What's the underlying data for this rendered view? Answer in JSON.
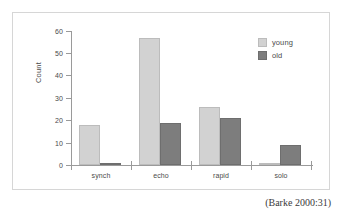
{
  "caption": "(Barke 2000:31)",
  "legend": {
    "position": "top-right",
    "entries": [
      {
        "label": "young",
        "color": "#d2d2d2"
      },
      {
        "label": "old",
        "color": "#7d7d7d"
      }
    ]
  },
  "axes": {
    "ylabel": "Count",
    "xlabel": "",
    "yticks": [
      "0",
      "10",
      "20",
      "30",
      "40",
      "50",
      "60"
    ],
    "xticks": [
      "synch",
      "echo",
      "rapid",
      "solo"
    ]
  },
  "chart_data": {
    "type": "bar",
    "title": "",
    "subtitle": "",
    "xlabel": "",
    "ylabel": "Count",
    "categories": [
      "synch",
      "echo",
      "rapid",
      "solo"
    ],
    "series": [
      {
        "name": "young",
        "color": "#d2d2d2",
        "values": [
          18,
          57,
          26,
          1
        ]
      },
      {
        "name": "old",
        "color": "#7d7d7d",
        "values": [
          1,
          19,
          21,
          9
        ]
      }
    ],
    "ylim": [
      0,
      60
    ],
    "ytick_step": 10,
    "grid": false,
    "legend_position": "top-right",
    "annotations": [
      "(Barke 2000:31)"
    ]
  }
}
